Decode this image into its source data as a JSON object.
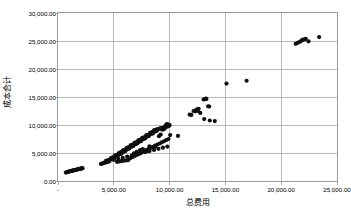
{
  "chart_data": {
    "type": "scatter",
    "title": "",
    "xlabel": "总费用",
    "ylabel": "成本合计",
    "xlim": [
      0,
      25000
    ],
    "ylim": [
      0,
      30000
    ],
    "grid": true,
    "legend": "none",
    "marker": "filled-circle",
    "marker_color": "#101010",
    "x_ticks": [
      {
        "value": 0,
        "label": "-"
      },
      {
        "value": 5000,
        "label": "5,000.00"
      },
      {
        "value": 10000,
        "label": "10,000.00"
      },
      {
        "value": 15000,
        "label": "15,000.00"
      },
      {
        "value": 20000,
        "label": "20,000.00"
      },
      {
        "value": 25000,
        "label": "25,000.00"
      }
    ],
    "y_ticks": [
      {
        "value": 0,
        "label": "0.00"
      },
      {
        "value": 5000,
        "label": "5,000.00"
      },
      {
        "value": 10000,
        "label": "10,000.00"
      },
      {
        "value": 15000,
        "label": "15,000.00"
      },
      {
        "value": 20000,
        "label": "20,000.00"
      },
      {
        "value": 25000,
        "label": "25,000.00"
      },
      {
        "value": 30000,
        "label": "30,000.00"
      }
    ],
    "series": [
      {
        "name": "成本合计 vs 总费用",
        "points": [
          [
            700,
            1500
          ],
          [
            780,
            1560
          ],
          [
            830,
            1600
          ],
          [
            900,
            1640
          ],
          [
            960,
            1680
          ],
          [
            1020,
            1700
          ],
          [
            1080,
            1740
          ],
          [
            1140,
            1770
          ],
          [
            1200,
            1800
          ],
          [
            1260,
            1830
          ],
          [
            1320,
            1860
          ],
          [
            1380,
            1890
          ],
          [
            1440,
            1920
          ],
          [
            1500,
            1950
          ],
          [
            1560,
            1980
          ],
          [
            1620,
            2000
          ],
          [
            1700,
            2050
          ],
          [
            1760,
            2080
          ],
          [
            1830,
            2110
          ],
          [
            1900,
            2150
          ],
          [
            1960,
            2180
          ],
          [
            2020,
            2200
          ],
          [
            2080,
            2230
          ],
          [
            2140,
            2260
          ],
          [
            2200,
            2290
          ],
          [
            3850,
            3050
          ],
          [
            3950,
            3120
          ],
          [
            4050,
            3180
          ],
          [
            4150,
            3240
          ],
          [
            4250,
            3300
          ],
          [
            4350,
            3360
          ],
          [
            4450,
            3420
          ],
          [
            4550,
            3480
          ],
          [
            4300,
            3600
          ],
          [
            4400,
            3660
          ],
          [
            4500,
            3700
          ],
          [
            4600,
            3760
          ],
          [
            4700,
            3820
          ],
          [
            4800,
            3880
          ],
          [
            4900,
            3940
          ],
          [
            5000,
            4000
          ],
          [
            4750,
            4100
          ],
          [
            4850,
            4160
          ],
          [
            4950,
            4220
          ],
          [
            5050,
            4280
          ],
          [
            5150,
            4340
          ],
          [
            5250,
            4400
          ],
          [
            5350,
            4450
          ],
          [
            5100,
            4550
          ],
          [
            5200,
            4600
          ],
          [
            5300,
            4660
          ],
          [
            5400,
            4720
          ],
          [
            5500,
            4780
          ],
          [
            5600,
            4840
          ],
          [
            5700,
            4900
          ],
          [
            5450,
            5000
          ],
          [
            5550,
            5060
          ],
          [
            5650,
            5120
          ],
          [
            5750,
            5180
          ],
          [
            5850,
            5240
          ],
          [
            5950,
            5300
          ],
          [
            6050,
            5360
          ],
          [
            5800,
            5450
          ],
          [
            5900,
            5500
          ],
          [
            6000,
            5560
          ],
          [
            6100,
            5620
          ],
          [
            6200,
            5680
          ],
          [
            6300,
            5740
          ],
          [
            6400,
            5800
          ],
          [
            6150,
            5900
          ],
          [
            6250,
            5950
          ],
          [
            6350,
            6010
          ],
          [
            6450,
            6070
          ],
          [
            6550,
            6130
          ],
          [
            6650,
            6190
          ],
          [
            6750,
            6250
          ],
          [
            6500,
            6350
          ],
          [
            6600,
            6400
          ],
          [
            6700,
            6460
          ],
          [
            6800,
            6520
          ],
          [
            6900,
            6580
          ],
          [
            7000,
            6640
          ],
          [
            7100,
            6700
          ],
          [
            6850,
            6800
          ],
          [
            6950,
            6850
          ],
          [
            7050,
            6910
          ],
          [
            7150,
            6970
          ],
          [
            7250,
            7030
          ],
          [
            7350,
            7090
          ],
          [
            7450,
            7150
          ],
          [
            7200,
            7250
          ],
          [
            7300,
            7300
          ],
          [
            7400,
            7360
          ],
          [
            7500,
            7420
          ],
          [
            7600,
            7480
          ],
          [
            7700,
            7540
          ],
          [
            7800,
            7600
          ],
          [
            7550,
            7700
          ],
          [
            7650,
            7750
          ],
          [
            7750,
            7810
          ],
          [
            7850,
            7870
          ],
          [
            7950,
            7930
          ],
          [
            8050,
            7990
          ],
          [
            8150,
            8050
          ],
          [
            7900,
            8150
          ],
          [
            8000,
            8200
          ],
          [
            8100,
            8260
          ],
          [
            8200,
            8320
          ],
          [
            8300,
            8380
          ],
          [
            8400,
            8440
          ],
          [
            8500,
            8500
          ],
          [
            8250,
            8600
          ],
          [
            8350,
            8650
          ],
          [
            8450,
            8710
          ],
          [
            8550,
            8770
          ],
          [
            8650,
            8830
          ],
          [
            8750,
            8890
          ],
          [
            8850,
            8950
          ],
          [
            8600,
            9050
          ],
          [
            8700,
            9100
          ],
          [
            8800,
            9160
          ],
          [
            8900,
            9220
          ],
          [
            9000,
            9280
          ],
          [
            9100,
            9340
          ],
          [
            9200,
            9400
          ],
          [
            9300,
            9450
          ],
          [
            9400,
            9500
          ],
          [
            9500,
            9560
          ],
          [
            9600,
            9620
          ],
          [
            9700,
            9680
          ],
          [
            9800,
            9740
          ],
          [
            9900,
            9800
          ],
          [
            9950,
            9900
          ],
          [
            10000,
            10000
          ],
          [
            9850,
            10100
          ],
          [
            9750,
            10150
          ],
          [
            9650,
            9950
          ],
          [
            9550,
            9350
          ],
          [
            9450,
            9250
          ],
          [
            9350,
            9150
          ],
          [
            5300,
            3400
          ],
          [
            5500,
            3500
          ],
          [
            5700,
            3560
          ],
          [
            5900,
            3620
          ],
          [
            6100,
            3680
          ],
          [
            6300,
            3740
          ],
          [
            6500,
            4100
          ],
          [
            6700,
            4300
          ],
          [
            6900,
            4500
          ],
          [
            7100,
            4700
          ],
          [
            7300,
            4900
          ],
          [
            7500,
            5100
          ],
          [
            7700,
            5300
          ],
          [
            7900,
            5500
          ],
          [
            8100,
            5700
          ],
          [
            8300,
            5900
          ],
          [
            8500,
            6100
          ],
          [
            8700,
            6300
          ],
          [
            8900,
            6500
          ],
          [
            9100,
            6700
          ],
          [
            9300,
            6900
          ],
          [
            9500,
            7100
          ],
          [
            9700,
            7300
          ],
          [
            9900,
            7500
          ],
          [
            10050,
            8200
          ],
          [
            7900,
            5450
          ],
          [
            8200,
            6200
          ],
          [
            8700,
            6100
          ],
          [
            9050,
            8000
          ],
          [
            9200,
            8300
          ],
          [
            8000,
            5350
          ],
          [
            7600,
            5700
          ],
          [
            7350,
            5500
          ],
          [
            7050,
            5200
          ],
          [
            6800,
            4950
          ],
          [
            4200,
            3350
          ],
          [
            4600,
            3550
          ],
          [
            5000,
            3750
          ],
          [
            5400,
            3950
          ],
          [
            5800,
            4150
          ],
          [
            6200,
            4350
          ],
          [
            6600,
            4550
          ],
          [
            7000,
            4750
          ],
          [
            7400,
            4950
          ],
          [
            7800,
            5150
          ],
          [
            8200,
            5350
          ],
          [
            8600,
            5550
          ],
          [
            9000,
            5750
          ],
          [
            9400,
            5950
          ],
          [
            9800,
            6150
          ],
          [
            10750,
            8050
          ],
          [
            11800,
            11850
          ],
          [
            11950,
            11800
          ],
          [
            12150,
            12500
          ],
          [
            12300,
            12450
          ],
          [
            12400,
            12750
          ],
          [
            12550,
            12500
          ],
          [
            12600,
            12900
          ],
          [
            13050,
            14550
          ],
          [
            13150,
            14600
          ],
          [
            13250,
            14700
          ],
          [
            13300,
            14650
          ],
          [
            13450,
            13350
          ],
          [
            13550,
            13300
          ],
          [
            13100,
            11050
          ],
          [
            13600,
            10800
          ],
          [
            14050,
            10700
          ],
          [
            12750,
            12150
          ],
          [
            15100,
            17400
          ],
          [
            16900,
            17900
          ],
          [
            21300,
            24500
          ],
          [
            21500,
            24700
          ],
          [
            21700,
            24900
          ],
          [
            21850,
            25100
          ],
          [
            21950,
            25250
          ],
          [
            22100,
            25300
          ],
          [
            22200,
            25400
          ],
          [
            22450,
            24950
          ],
          [
            23400,
            25700
          ]
        ]
      }
    ]
  }
}
